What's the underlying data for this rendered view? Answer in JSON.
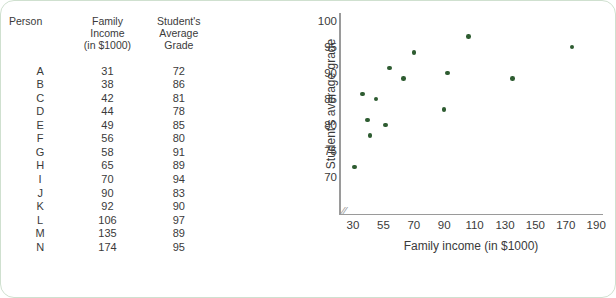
{
  "table": {
    "headers": {
      "person": [
        "Person"
      ],
      "income": [
        "Family",
        "Income",
        "(in $1000)"
      ],
      "grade": [
        "Student's",
        "Average",
        "Grade"
      ]
    },
    "rows": [
      {
        "person": "A",
        "income": "31",
        "grade": "72"
      },
      {
        "person": "B",
        "income": "38",
        "grade": "86"
      },
      {
        "person": "C",
        "income": "42",
        "grade": "81"
      },
      {
        "person": "D",
        "income": "44",
        "grade": "78"
      },
      {
        "person": "E",
        "income": "49",
        "grade": "85"
      },
      {
        "person": "F",
        "income": "56",
        "grade": "80"
      },
      {
        "person": "G",
        "income": "58",
        "grade": "91"
      },
      {
        "person": "H",
        "income": "65",
        "grade": "89"
      },
      {
        "person": "I",
        "income": "70",
        "grade": "94"
      },
      {
        "person": "J",
        "income": "90",
        "grade": "83"
      },
      {
        "person": "K",
        "income": "92",
        "grade": "90"
      },
      {
        "person": "L",
        "income": "106",
        "grade": "97"
      },
      {
        "person": "M",
        "income": "135",
        "grade": "89"
      },
      {
        "person": "N",
        "income": "174",
        "grade": "95"
      }
    ]
  },
  "chart_data": {
    "type": "scatter",
    "title": "",
    "xlabel": "Family income (in $1000)",
    "ylabel": "Student's average grade",
    "grid": false,
    "legend": false,
    "axis_break_x": true,
    "xtick_labels": [
      "30",
      "55",
      "70",
      "90",
      "110",
      "130",
      "150",
      "170",
      "190"
    ],
    "ytick_labels": [
      "100",
      "95",
      "90",
      "85",
      "80",
      "75",
      "70"
    ],
    "ylim": [
      68,
      101
    ],
    "point_color": "#2e5c31",
    "axis_color": "#9a9a9a",
    "points": [
      {
        "label": "A",
        "x": 31,
        "y": 72
      },
      {
        "label": "B",
        "x": 38,
        "y": 86
      },
      {
        "label": "C",
        "x": 42,
        "y": 81
      },
      {
        "label": "D",
        "x": 44,
        "y": 78
      },
      {
        "label": "E",
        "x": 49,
        "y": 85
      },
      {
        "label": "F",
        "x": 56,
        "y": 80
      },
      {
        "label": "G",
        "x": 58,
        "y": 91
      },
      {
        "label": "H",
        "x": 65,
        "y": 89
      },
      {
        "label": "I",
        "x": 70,
        "y": 94
      },
      {
        "label": "J",
        "x": 90,
        "y": 83
      },
      {
        "label": "K",
        "x": 92,
        "y": 90
      },
      {
        "label": "L",
        "x": 106,
        "y": 97
      },
      {
        "label": "M",
        "x": 135,
        "y": 89
      },
      {
        "label": "N",
        "x": 174,
        "y": 95
      }
    ]
  }
}
